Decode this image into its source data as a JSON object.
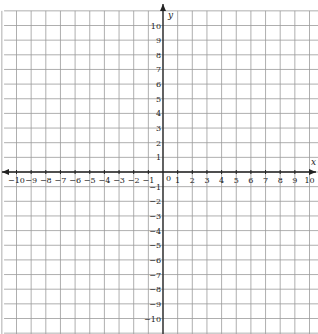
{
  "chart_data": {
    "type": "scatter",
    "title": "",
    "xlabel": "x",
    "ylabel": "y",
    "xlim": [
      -10,
      10
    ],
    "ylim": [
      -10,
      10
    ],
    "grid": true,
    "x_ticks": [
      -10,
      -9,
      -8,
      -7,
      -6,
      -5,
      -4,
      -3,
      -2,
      -1,
      1,
      2,
      3,
      4,
      5,
      6,
      7,
      8,
      9,
      10
    ],
    "y_ticks": [
      10,
      9,
      8,
      7,
      6,
      5,
      4,
      3,
      2,
      1,
      -1,
      -2,
      -3,
      -4,
      -5,
      -6,
      -7,
      -8,
      -9,
      -10
    ],
    "origin_label": "0",
    "series": []
  },
  "colors": {
    "grid": "#9a9a9a",
    "axis": "#222222",
    "background": "#ffffff"
  }
}
